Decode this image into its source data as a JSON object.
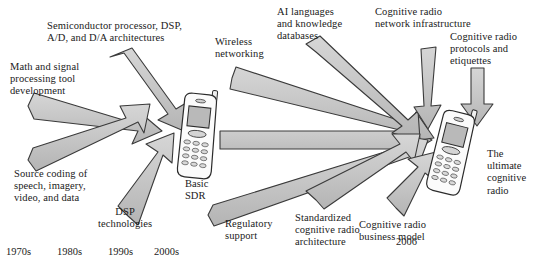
{
  "figure": {
    "background_color": "#ffffff",
    "arrow_fill": "#c8c8c8",
    "arrow_stroke": "#3a3a3a",
    "text_color": "#1a1a1a"
  },
  "nodes": [
    {
      "id": "basic-sdr",
      "label": "Basic\nSDR",
      "kind": "mobile-phone",
      "x": 180,
      "y": 100
    },
    {
      "id": "ultimate-cognitive-radio",
      "label": "The\nultimate\ncognitive\nradio",
      "kind": "mobile-phone",
      "x": 438,
      "y": 112
    }
  ],
  "inputs_left": [
    {
      "id": "semiconductor",
      "label": "Semiconductor processor, DSP,\nA/D, and D/A architectures",
      "target": "basic-sdr"
    },
    {
      "id": "math-signal",
      "label": "Math and signal\nprocessing tool\ndevelopment",
      "target": "basic-sdr"
    },
    {
      "id": "source-coding",
      "label": "Source coding of\nspeech, imagery,\nvideo, and data",
      "target": "basic-sdr"
    },
    {
      "id": "dsp-technologies",
      "label": "DSP\ntechnologies",
      "target": "basic-sdr"
    }
  ],
  "inputs_right": [
    {
      "id": "wireless-networking",
      "label": "Wireless\nnetworking",
      "target": "ultimate-cognitive-radio"
    },
    {
      "id": "ai-languages",
      "label": "AI languages\nand knowledge\ndatabases",
      "target": "ultimate-cognitive-radio"
    },
    {
      "id": "cr-network-infrastructure",
      "label": "Cognitive radio\nnetwork infrastructure",
      "target": "ultimate-cognitive-radio"
    },
    {
      "id": "cr-protocols",
      "label": "Cognitive radio\nprotocols and\netiquettes",
      "target": "ultimate-cognitive-radio"
    },
    {
      "id": "regulatory-support",
      "label": "Regulatory\nsupport",
      "target": "ultimate-cognitive-radio"
    },
    {
      "id": "standardized-cr-architecture",
      "label": "Standardized\ncognitive radio\narchitecture",
      "target": "ultimate-cognitive-radio"
    },
    {
      "id": "cr-business-model",
      "label": "Cognitive radio\nbusiness model",
      "target": "ultimate-cognitive-radio"
    }
  ],
  "main_flow": {
    "from": "basic-sdr",
    "to": "ultimate-cognitive-radio",
    "style": "long-horizontal-arrow"
  },
  "timeline": {
    "ticks": [
      "1970s",
      "1980s",
      "1990s",
      "2000s"
    ],
    "end_year": "2006"
  }
}
